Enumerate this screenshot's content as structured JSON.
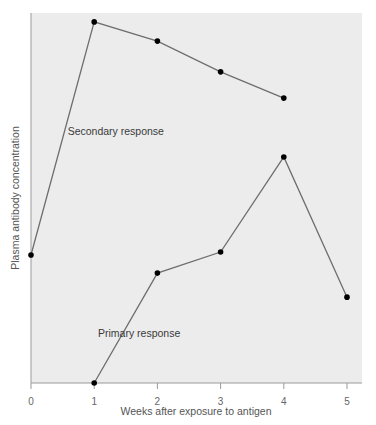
{
  "chart_data": {
    "type": "line",
    "title": "",
    "xlabel": "Weeks after exposure to antigen",
    "ylabel": "Plasma antibody concentration",
    "x_ticks": [
      "0",
      "1",
      "2",
      "3",
      "4",
      "5"
    ],
    "xlim": [
      0,
      5.25
    ],
    "ylim": [
      0,
      100
    ],
    "y_units": "relative (no scale shown)",
    "grid": false,
    "legend": "none (series labeled inline)",
    "plot_background": "#ececec",
    "line_color": "#6e6e6e",
    "marker_color": "#000000",
    "series": [
      {
        "name": "Secondary response",
        "x": [
          0,
          1,
          2,
          3,
          4
        ],
        "values": [
          34.6,
          97.6,
          92.4,
          84.1,
          77.0
        ],
        "label_pos": {
          "x": 0.58,
          "y": 67
        }
      },
      {
        "name": "Primary response",
        "x": [
          1,
          2,
          3,
          4,
          5
        ],
        "values": [
          0,
          29.7,
          35.4,
          61.1,
          23.2
        ],
        "label_pos": {
          "x": 1.06,
          "y": 12.5
        }
      }
    ]
  }
}
